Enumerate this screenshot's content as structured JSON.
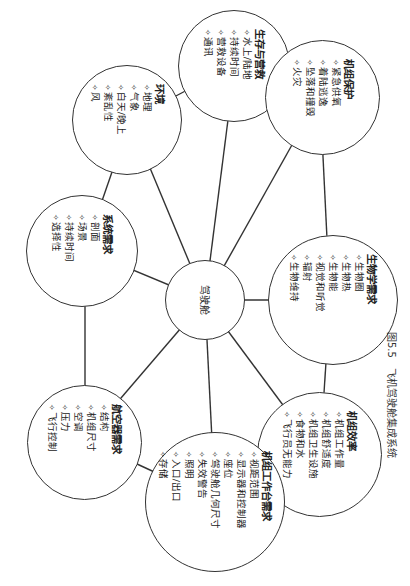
{
  "figure": {
    "caption_number": "图5.5",
    "caption_text": "飞机驾驶舱集成系统",
    "line_color": "#333333",
    "center": {
      "label": "驾驶舱"
    },
    "nodes": [
      {
        "id": "survival",
        "title": "生存与营救",
        "items": [
          "水上/陆地",
          "持续时间",
          "营救设备",
          "通讯"
        ]
      },
      {
        "id": "crew-protection",
        "title": "机组保护",
        "items": [
          "紧急供氧",
          "着陆逃逸",
          "坠落和撞毁",
          "火灾"
        ]
      },
      {
        "id": "biology",
        "title": "生物学需求",
        "items": [
          "生物圈",
          "生物热",
          "生物能",
          "视觉和听觉",
          "辐射",
          "生物维持"
        ]
      },
      {
        "id": "crew-efficiency",
        "title": "机组效率",
        "items": [
          "机组工作量",
          "机组舒适度",
          "机组卫生设施",
          "食物和水",
          "飞行员无能力"
        ]
      },
      {
        "id": "workstation",
        "title": "机组工作台需求",
        "items": [
          "视距范围",
          "显示器和控制器",
          "座位",
          "驾驶舱几何尺寸",
          "失效警告",
          "照明",
          "入口/出口",
          "存储"
        ]
      },
      {
        "id": "aircraft",
        "title": "航空器需求",
        "items": [
          "结构",
          "机组尺寸",
          "空调",
          "压力",
          "飞行控制"
        ]
      },
      {
        "id": "system",
        "title": "系统需求",
        "items": [
          "剖面",
          "场景",
          "持续时间",
          "选择性"
        ]
      },
      {
        "id": "environment",
        "title": "环境",
        "items": [
          "地理",
          "气象",
          "白天/晚上",
          "紊乱性",
          "风"
        ]
      }
    ]
  }
}
